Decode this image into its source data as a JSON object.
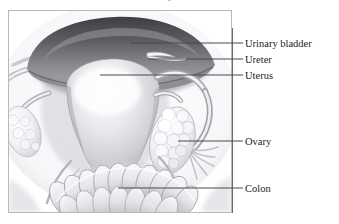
{
  "figure": {
    "kind": "anatomical-illustration",
    "title_fragment": ".",
    "frame": {
      "x": 8,
      "y": 10,
      "width": 224,
      "height": 203
    },
    "background_color": "#ffffff",
    "frame_border_color": "#b9b9bd",
    "line_color": "#4a4a4a",
    "text_color": "#1c1c1c"
  },
  "callouts": {
    "spine_x": 232,
    "spine_top": 28,
    "spine_bottom": 213,
    "items": [
      {
        "id": "urinary-bladder",
        "label": "Urinary bladder",
        "text_x": 245,
        "text_y": 38,
        "tick_y": 43,
        "leader_from_x": 130,
        "leader_y": 43
      },
      {
        "id": "ureter",
        "label": "Ureter",
        "text_x": 245,
        "text_y": 54,
        "tick_y": 59,
        "leader_from_x": 148,
        "leader_y": 59
      },
      {
        "id": "uterus",
        "label": "Uterus",
        "text_x": 245,
        "text_y": 70,
        "tick_y": 75,
        "leader_from_x": 100,
        "leader_y": 75
      },
      {
        "id": "ovary",
        "label": "Ovary",
        "text_x": 245,
        "text_y": 136,
        "tick_y": 141,
        "leader_from_x": 178,
        "leader_y": 141
      },
      {
        "id": "colon",
        "label": "Colon",
        "text_x": 245,
        "text_y": 183,
        "tick_y": 188,
        "leader_from_x": 118,
        "leader_y": 188
      }
    ]
  },
  "anatomy_parts": [
    {
      "id": "urinary-bladder",
      "name": "Urinary bladder",
      "tone": "dark-grey-dome"
    },
    {
      "id": "ureter",
      "name": "Ureter",
      "tone": "light-tube"
    },
    {
      "id": "uterus",
      "name": "Uterus",
      "tone": "pale-grey-body"
    },
    {
      "id": "ovary-right",
      "name": "Ovary",
      "tone": "bumpy-white-oval"
    },
    {
      "id": "ovary-left",
      "name": "Ovary",
      "tone": "bumpy-white-oval"
    },
    {
      "id": "fallopian-tube-right",
      "name": "Fallopian tube",
      "tone": "light-curved-tube"
    },
    {
      "id": "fallopian-tube-left",
      "name": "Fallopian tube",
      "tone": "light-curved-tube"
    },
    {
      "id": "colon",
      "name": "Colon",
      "tone": "segmented-haustra"
    }
  ]
}
